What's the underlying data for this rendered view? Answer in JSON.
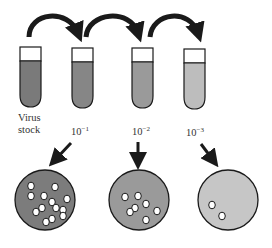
{
  "colors": {
    "outline": "#1a1a1a",
    "arrow": "#1a1a1a",
    "tube_cap": "#ffffff",
    "plaque": "#ffffff"
  },
  "tubes": [
    {
      "id": "virus-stock",
      "label_line1": "Virus",
      "label_line2": "stock",
      "fill": "#7a7a7a",
      "x": 20
    },
    {
      "id": "dilution-1",
      "base": "10",
      "exponent": "−1",
      "fill": "#868686",
      "x": 72
    },
    {
      "id": "dilution-2",
      "base": "10",
      "exponent": "−2",
      "fill": "#9a9a9a",
      "x": 132
    },
    {
      "id": "dilution-3",
      "base": "10",
      "exponent": "−3",
      "fill": "#bdbdbd",
      "x": 184
    }
  ],
  "transfer_arrows": [
    {
      "from": "virus-stock",
      "to": "dilution-1"
    },
    {
      "from": "dilution-1",
      "to": "dilution-2"
    },
    {
      "from": "dilution-2",
      "to": "dilution-3"
    }
  ],
  "plates": [
    {
      "source": "dilution-1",
      "fill": "#7c7c7c",
      "plaque_count": 13
    },
    {
      "source": "dilution-2",
      "fill": "#9a9a9a",
      "plaque_count": 7
    },
    {
      "source": "dilution-3",
      "fill": "#c6c6c6",
      "plaque_count": 2
    }
  ]
}
